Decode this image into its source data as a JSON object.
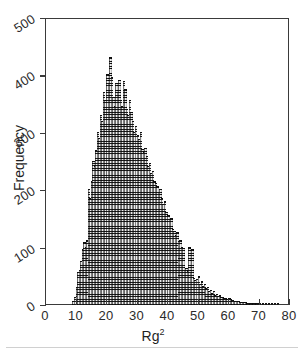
{
  "chart_data": {
    "type": "bar",
    "title": "",
    "subtitle": "",
    "xlabel": "Rg²",
    "ylabel": "Frequency",
    "xlim": [
      0,
      80
    ],
    "ylim": [
      0,
      500
    ],
    "xticks": [
      0,
      10,
      20,
      30,
      40,
      50,
      60,
      70,
      80
    ],
    "yticks": [
      0,
      100,
      200,
      300,
      400,
      500
    ],
    "xtick_labels": [
      "0",
      "10",
      "20",
      "30",
      "40",
      "50",
      "60",
      "70",
      "80"
    ],
    "ytick_labels": [
      "0",
      "100",
      "200",
      "300",
      "400",
      "500"
    ],
    "grid": false,
    "legend": null,
    "bin_width": 0.5,
    "bar_color": "#6d6d6d",
    "axis_color": "#3a3a3a",
    "background_color": "#ffffff",
    "x": [
      9.0,
      9.5,
      10.0,
      10.5,
      11.0,
      11.5,
      12.0,
      12.5,
      13.0,
      13.5,
      14.0,
      14.5,
      15.0,
      15.5,
      16.0,
      16.5,
      17.0,
      17.5,
      18.0,
      18.5,
      19.0,
      19.5,
      20.0,
      20.5,
      21.0,
      21.5,
      22.0,
      22.5,
      23.0,
      23.5,
      24.0,
      24.5,
      25.0,
      25.5,
      26.0,
      26.5,
      27.0,
      27.5,
      28.0,
      28.5,
      29.0,
      29.5,
      30.0,
      30.5,
      31.0,
      31.5,
      32.0,
      32.5,
      33.0,
      33.5,
      34.0,
      34.5,
      35.0,
      35.5,
      36.0,
      36.5,
      37.0,
      37.5,
      38.0,
      38.5,
      39.0,
      39.5,
      40.0,
      40.5,
      41.0,
      41.5,
      42.0,
      42.5,
      43.0,
      43.5,
      44.0,
      44.5,
      45.0,
      45.5,
      46.0,
      46.5,
      47.0,
      47.5,
      48.0,
      48.5,
      49.0,
      49.5,
      50.0,
      50.5,
      51.0,
      51.5,
      52.0,
      52.5,
      53.0,
      53.5,
      54.0,
      54.5,
      55.0,
      55.5,
      56.0,
      56.5,
      57.0,
      57.5,
      58.0,
      58.5,
      59.0,
      59.5,
      60.0,
      60.5,
      61.0,
      61.5,
      62.0,
      62.5,
      63.0,
      63.5,
      64.0,
      64.5,
      65.0,
      65.5,
      66.0,
      66.5,
      67.0,
      67.5,
      68.0,
      68.5,
      69.0,
      69.5,
      70.0,
      71.0,
      72.0,
      73.0,
      74.0,
      75.0,
      76.0
    ],
    "values": [
      5,
      12,
      30,
      55,
      60,
      75,
      95,
      108,
      100,
      112,
      200,
      185,
      215,
      250,
      240,
      268,
      300,
      290,
      330,
      318,
      370,
      355,
      400,
      385,
      430,
      395,
      360,
      345,
      385,
      370,
      390,
      355,
      345,
      388,
      375,
      340,
      330,
      355,
      335,
      318,
      300,
      310,
      295,
      288,
      300,
      270,
      265,
      272,
      258,
      240,
      245,
      228,
      232,
      215,
      210,
      205,
      195,
      200,
      185,
      175,
      180,
      160,
      155,
      148,
      150,
      130,
      128,
      120,
      125,
      110,
      112,
      100,
      98,
      60,
      62,
      58,
      100,
      55,
      95,
      45,
      42,
      44,
      48,
      35,
      40,
      32,
      35,
      28,
      30,
      22,
      24,
      20,
      22,
      16,
      18,
      14,
      15,
      12,
      13,
      10,
      11,
      9,
      10,
      8,
      7,
      6,
      6,
      5,
      5,
      4,
      4,
      3,
      3,
      3,
      2,
      2,
      2,
      2,
      2,
      1,
      1,
      1,
      1,
      1,
      1,
      1,
      1,
      1,
      1
    ],
    "peak": {
      "x": 21.0,
      "y": 430
    }
  }
}
